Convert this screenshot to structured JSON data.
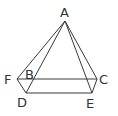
{
  "diagram": {
    "type": "geometry-pyramid",
    "labels": {
      "A": "A",
      "B": "B",
      "C": "C",
      "D": "D",
      "E": "E",
      "F": "F"
    },
    "points": {
      "A": [
        65,
        21
      ],
      "F": [
        17,
        79
      ],
      "C": [
        97,
        79
      ],
      "D": [
        26,
        93
      ],
      "E": [
        92,
        93
      ]
    },
    "edges": [
      [
        "A",
        "F"
      ],
      [
        "A",
        "D"
      ],
      [
        "A",
        "E"
      ],
      [
        "A",
        "C"
      ],
      [
        "F",
        "C"
      ],
      [
        "D",
        "E"
      ],
      [
        "F",
        "D"
      ],
      [
        "C",
        "E"
      ]
    ],
    "line_color": "#3a3a3a"
  }
}
